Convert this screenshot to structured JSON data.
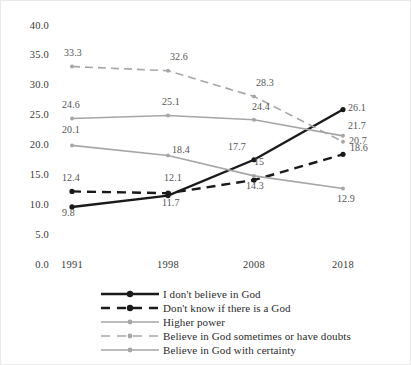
{
  "chart_data": {
    "type": "line",
    "title": "",
    "xlabel": "",
    "ylabel": "",
    "categories": [
      "1991",
      "1998",
      "2008",
      "2018"
    ],
    "ylim": [
      0,
      40
    ],
    "ytick_values": [
      0.0,
      5.0,
      10.0,
      15.0,
      20.0,
      25.0,
      30.0,
      35.0,
      40.0
    ],
    "ytick_labels": [
      "0.0",
      "5.0",
      "10.0",
      "15.0",
      "20.0",
      "25.0",
      "30.0",
      "35.0",
      "40.0"
    ],
    "grid": false,
    "legend_position": "bottom",
    "series": [
      {
        "name": "I don't believe in God",
        "values": [
          9.8,
          11.7,
          17.7,
          26.1
        ],
        "labels": [
          "9.8",
          "11.7",
          "17.7",
          "26.1"
        ],
        "color": "#1a1a1a",
        "dash": "solid"
      },
      {
        "name": "Don't know if there is a God",
        "values": [
          12.4,
          12.1,
          14.3,
          18.6
        ],
        "labels": [
          "12.4",
          "12.1",
          "14.3",
          "18.6"
        ],
        "color": "#1a1a1a",
        "dash": "dashed"
      },
      {
        "name": "Higher power",
        "values": [
          20.1,
          18.4,
          15.0,
          12.9
        ],
        "labels": [
          "20.1",
          "18.4",
          "15",
          "12.9"
        ],
        "color": "#a6a6a6",
        "dash": "solid"
      },
      {
        "name": "Believe in God sometimes or have doubts",
        "values": [
          33.3,
          32.6,
          28.3,
          20.7
        ],
        "labels": [
          "33.3",
          "32.6",
          "28.3",
          "20.7"
        ],
        "color": "#a6a6a6",
        "dash": "dashed"
      },
      {
        "name": "Believe in God with certainty",
        "values": [
          24.6,
          25.1,
          24.4,
          21.7
        ],
        "labels": [
          "24.6",
          "25.1",
          "24.4",
          "21.7"
        ],
        "color": "#a6a6a6",
        "dash": "solid"
      }
    ]
  },
  "legend": {
    "items": [
      {
        "label": "I don't believe in God"
      },
      {
        "label": "Don't know if there is a God"
      },
      {
        "label": "Higher power"
      },
      {
        "label": "Believe in God sometimes or have doubts"
      },
      {
        "label": "Believe in God with certainty"
      }
    ]
  }
}
